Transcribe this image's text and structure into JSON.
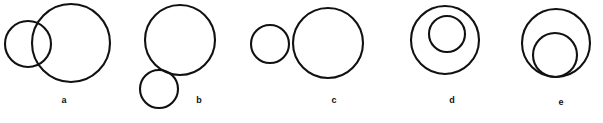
{
  "figure": {
    "background_color": "#ffffff",
    "stroke_color": "#111111",
    "label_color": "#111111",
    "width": 603,
    "height": 123
  },
  "chart_data": {
    "type": "diagram",
    "title": "",
    "subtitle": "",
    "xlabel": "",
    "ylabel": "",
    "grid": false,
    "legend": false,
    "panels": [
      {
        "label": "a",
        "relation": "intersecting",
        "label_x": 64,
        "label_y": 96,
        "circles": [
          {
            "name": "small-circle",
            "cx": 28,
            "cy": 44,
            "r": 23,
            "stroke_width": 2.1
          },
          {
            "name": "large-circle",
            "cx": 71,
            "cy": 43,
            "r": 39,
            "stroke_width": 2.1
          }
        ]
      },
      {
        "label": "b",
        "relation": "externally-tangent",
        "label_x": 199,
        "label_y": 96,
        "circles": [
          {
            "name": "large-circle",
            "cx": 180,
            "cy": 40,
            "r": 35,
            "stroke_width": 2.1
          },
          {
            "name": "small-circle",
            "cx": 159,
            "cy": 89,
            "r": 19,
            "stroke_width": 2.1
          }
        ]
      },
      {
        "label": "c",
        "relation": "separate",
        "label_x": 334,
        "label_y": 96,
        "circles": [
          {
            "name": "small-circle",
            "cx": 270,
            "cy": 44,
            "r": 19,
            "stroke_width": 2.1
          },
          {
            "name": "large-circle",
            "cx": 328,
            "cy": 43,
            "r": 35,
            "stroke_width": 2.1
          }
        ]
      },
      {
        "label": "d",
        "relation": "contained",
        "label_x": 452,
        "label_y": 96,
        "circles": [
          {
            "name": "outer-circle",
            "cx": 445,
            "cy": 40,
            "r": 34,
            "stroke_width": 2.1
          },
          {
            "name": "inner-circle",
            "cx": 447,
            "cy": 34,
            "r": 18,
            "stroke_width": 2.1
          }
        ]
      },
      {
        "label": "e",
        "relation": "internally-tangent",
        "label_x": 561,
        "label_y": 98,
        "circles": [
          {
            "name": "outer-circle",
            "cx": 556,
            "cy": 43,
            "r": 34,
            "stroke_width": 2.1
          },
          {
            "name": "inner-circle",
            "cx": 555,
            "cy": 55,
            "r": 22,
            "stroke_width": 2.1
          }
        ]
      }
    ]
  }
}
